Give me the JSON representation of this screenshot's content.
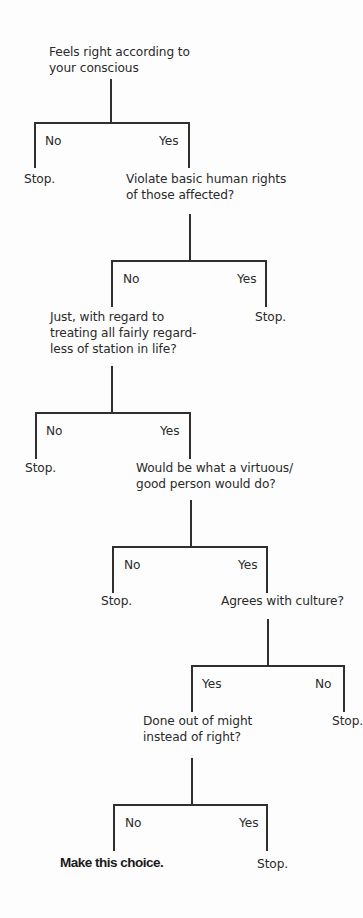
{
  "diagram": {
    "type": "decision-tree",
    "nodes": [
      {
        "id": "q1",
        "text": "Feels right according to\nyour conscious"
      },
      {
        "id": "q2",
        "text": "Violate basic human rights\nof those affected?"
      },
      {
        "id": "q3",
        "text": "Just, with regard to\ntreating all fairly regard-\nless of station in life?"
      },
      {
        "id": "q4",
        "text": "Would be what a virtuous/\ngood person would do?"
      },
      {
        "id": "q5",
        "text": "Agrees with culture?"
      },
      {
        "id": "q6",
        "text": "Done out of might\ninstead of right?"
      }
    ],
    "branches": [
      {
        "from": "q1",
        "left_label": "No",
        "left_outcome": "Stop.",
        "right_label": "Yes",
        "right_outcome": "q2"
      },
      {
        "from": "q2",
        "left_label": "No",
        "left_outcome": "q3",
        "right_label": "Yes",
        "right_outcome": "Stop."
      },
      {
        "from": "q3",
        "left_label": "No",
        "left_outcome": "Stop.",
        "right_label": "Yes",
        "right_outcome": "q4"
      },
      {
        "from": "q4",
        "left_label": "No",
        "left_outcome": "Stop.",
        "right_label": "Yes",
        "right_outcome": "q5"
      },
      {
        "from": "q5",
        "left_label": "Yes",
        "left_outcome": "q6",
        "right_label": "No",
        "right_outcome": "Stop."
      },
      {
        "from": "q6",
        "left_label": "No",
        "left_outcome": "Make this choice.",
        "right_label": "Yes",
        "right_outcome": "Stop."
      }
    ],
    "stop_label": "Stop.",
    "final_label": "Make this choice."
  }
}
